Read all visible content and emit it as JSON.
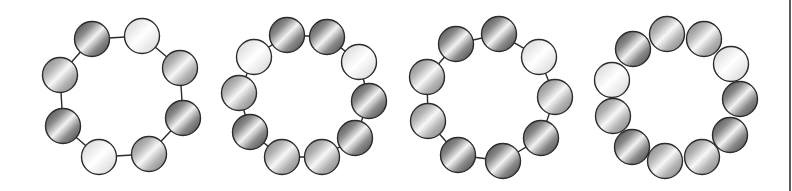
{
  "figure": {
    "width": 792,
    "height": 191,
    "background": "#ffffff",
    "stroke_color": "#2b2b2b",
    "bead_radius": 17.5,
    "shades": {
      "dark": {
        "edge": "#3c3c3c",
        "mid": "#8a8a8a",
        "highlight": "#f2f2f2"
      },
      "mid": {
        "edge": "#777777",
        "mid": "#b4b4b4",
        "highlight": "#f7f7f7"
      },
      "light": {
        "edge": "#cfcfcf",
        "mid": "#ececec",
        "highlight": "#ffffff"
      }
    }
  },
  "rings": [
    {
      "id": "ring-1",
      "connected_by_lines": true,
      "beads": [
        {
          "x": 92,
          "y": 39,
          "shade": "dark"
        },
        {
          "x": 142,
          "y": 36,
          "shade": "light"
        },
        {
          "x": 180,
          "y": 68,
          "shade": "mid"
        },
        {
          "x": 183,
          "y": 118,
          "shade": "dark"
        },
        {
          "x": 149,
          "y": 154,
          "shade": "mid"
        },
        {
          "x": 99,
          "y": 157,
          "shade": "light"
        },
        {
          "x": 63,
          "y": 126,
          "shade": "dark"
        },
        {
          "x": 60,
          "y": 75,
          "shade": "mid"
        }
      ]
    },
    {
      "id": "ring-2",
      "connected_by_lines": true,
      "beads": [
        {
          "x": 287,
          "y": 35,
          "shade": "dark"
        },
        {
          "x": 327,
          "y": 37,
          "shade": "dark"
        },
        {
          "x": 359,
          "y": 62,
          "shade": "light"
        },
        {
          "x": 369,
          "y": 101,
          "shade": "dark"
        },
        {
          "x": 355,
          "y": 138,
          "shade": "dark"
        },
        {
          "x": 322,
          "y": 157,
          "shade": "mid"
        },
        {
          "x": 282,
          "y": 157,
          "shade": "mid"
        },
        {
          "x": 250,
          "y": 132,
          "shade": "dark"
        },
        {
          "x": 239,
          "y": 93,
          "shade": "mid"
        },
        {
          "x": 254,
          "y": 57,
          "shade": "light"
        }
      ]
    },
    {
      "id": "ring-3",
      "connected_by_lines": true,
      "beads": [
        {
          "x": 456,
          "y": 44,
          "shade": "dark"
        },
        {
          "x": 499,
          "y": 34,
          "shade": "dark"
        },
        {
          "x": 539,
          "y": 57,
          "shade": "light"
        },
        {
          "x": 555,
          "y": 97,
          "shade": "mid"
        },
        {
          "x": 541,
          "y": 138,
          "shade": "dark"
        },
        {
          "x": 503,
          "y": 161,
          "shade": "dark"
        },
        {
          "x": 458,
          "y": 155,
          "shade": "dark"
        },
        {
          "x": 428,
          "y": 121,
          "shade": "mid"
        },
        {
          "x": 427,
          "y": 77,
          "shade": "mid"
        }
      ]
    },
    {
      "id": "ring-4",
      "connected_by_lines": false,
      "beads": [
        {
          "x": 633,
          "y": 49,
          "shade": "dark"
        },
        {
          "x": 667,
          "y": 34,
          "shade": "mid"
        },
        {
          "x": 704,
          "y": 39,
          "shade": "mid"
        },
        {
          "x": 731,
          "y": 64,
          "shade": "light"
        },
        {
          "x": 740,
          "y": 99,
          "shade": "dark"
        },
        {
          "x": 730,
          "y": 135,
          "shade": "dark"
        },
        {
          "x": 702,
          "y": 157,
          "shade": "mid"
        },
        {
          "x": 665,
          "y": 161,
          "shade": "mid"
        },
        {
          "x": 632,
          "y": 147,
          "shade": "dark"
        },
        {
          "x": 613,
          "y": 116,
          "shade": "mid"
        },
        {
          "x": 612,
          "y": 80,
          "shade": "light"
        }
      ]
    }
  ]
}
